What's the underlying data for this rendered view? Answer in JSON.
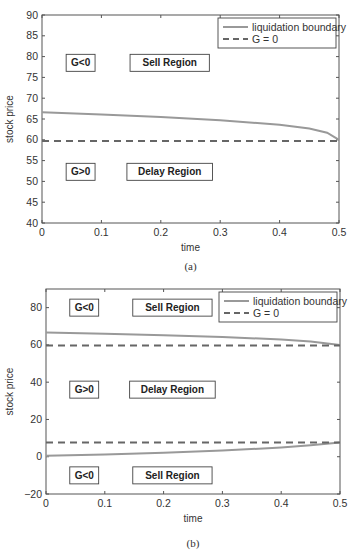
{
  "chart_data": [
    {
      "panel": "a",
      "caption": "(a)",
      "type": "line",
      "title": "",
      "xlabel": "time",
      "ylabel": "stock price",
      "xlim": [
        0,
        0.5
      ],
      "ylim": [
        40,
        90
      ],
      "xticks": [
        "0",
        "0.1",
        "0.2",
        "0.3",
        "0.4",
        "0.5"
      ],
      "yticks": [
        "40",
        "45",
        "50",
        "55",
        "60",
        "65",
        "70",
        "75",
        "80",
        "85",
        "90"
      ],
      "grid": false,
      "legend_position": "upper right",
      "legend": [
        "liquidation boundary",
        "G = 0"
      ],
      "series": [
        {
          "name": "liquidation boundary",
          "style": "solid",
          "color": "#999999",
          "x": [
            0,
            0.1,
            0.2,
            0.3,
            0.4,
            0.45,
            0.48,
            0.5
          ],
          "y": [
            66.6,
            66.1,
            65.5,
            64.7,
            63.6,
            62.7,
            61.7,
            60.0
          ]
        },
        {
          "name": "G = 0",
          "style": "dashed",
          "color": "#666666",
          "x": [
            0,
            0.5
          ],
          "y": [
            59.7,
            59.7
          ]
        }
      ],
      "annotations": [
        {
          "text": "G<0",
          "x": 0.065,
          "y": 78.5
        },
        {
          "text": "Sell Region",
          "x": 0.215,
          "y": 78.5
        },
        {
          "text": "G>0",
          "x": 0.065,
          "y": 52.3
        },
        {
          "text": "Delay Region",
          "x": 0.215,
          "y": 52.3
        }
      ]
    },
    {
      "panel": "b",
      "caption": "(b)",
      "type": "line",
      "title": "",
      "xlabel": "time",
      "ylabel": "stock price",
      "xlim": [
        0,
        0.5
      ],
      "ylim": [
        -20,
        90
      ],
      "xticks": [
        "0",
        "0.1",
        "0.2",
        "0.3",
        "0.4",
        "0.5"
      ],
      "yticks": [
        "−20",
        "0",
        "20",
        "40",
        "60",
        "80"
      ],
      "grid": false,
      "legend_position": "upper right",
      "legend": [
        "liquidation boundary",
        "G = 0"
      ],
      "series": [
        {
          "name": "liquidation boundary (upper)",
          "style": "solid",
          "color": "#999999",
          "x": [
            0,
            0.1,
            0.2,
            0.3,
            0.4,
            0.45,
            0.5
          ],
          "y": [
            66.6,
            66.0,
            65.2,
            64.3,
            62.9,
            61.8,
            60.0
          ]
        },
        {
          "name": "liquidation boundary (lower)",
          "style": "solid",
          "color": "#999999",
          "x": [
            0,
            0.1,
            0.2,
            0.3,
            0.4,
            0.45,
            0.5
          ],
          "y": [
            0.5,
            1.2,
            2.1,
            3.3,
            5.0,
            6.2,
            7.7
          ]
        },
        {
          "name": "G = 0 (upper)",
          "style": "dashed",
          "color": "#666666",
          "x": [
            0,
            0.5
          ],
          "y": [
            59.7,
            59.7
          ]
        },
        {
          "name": "G = 0 (lower)",
          "style": "dashed",
          "color": "#666666",
          "x": [
            0,
            0.5
          ],
          "y": [
            7.7,
            7.7
          ]
        }
      ],
      "annotations": [
        {
          "text": "G<0",
          "x": 0.065,
          "y": 80
        },
        {
          "text": "Sell Region",
          "x": 0.215,
          "y": 80
        },
        {
          "text": "G>0",
          "x": 0.065,
          "y": 36
        },
        {
          "text": "Delay Region",
          "x": 0.215,
          "y": 36
        },
        {
          "text": "G<0",
          "x": 0.065,
          "y": -10
        },
        {
          "text": "Sell Region",
          "x": 0.215,
          "y": -10
        }
      ]
    }
  ]
}
